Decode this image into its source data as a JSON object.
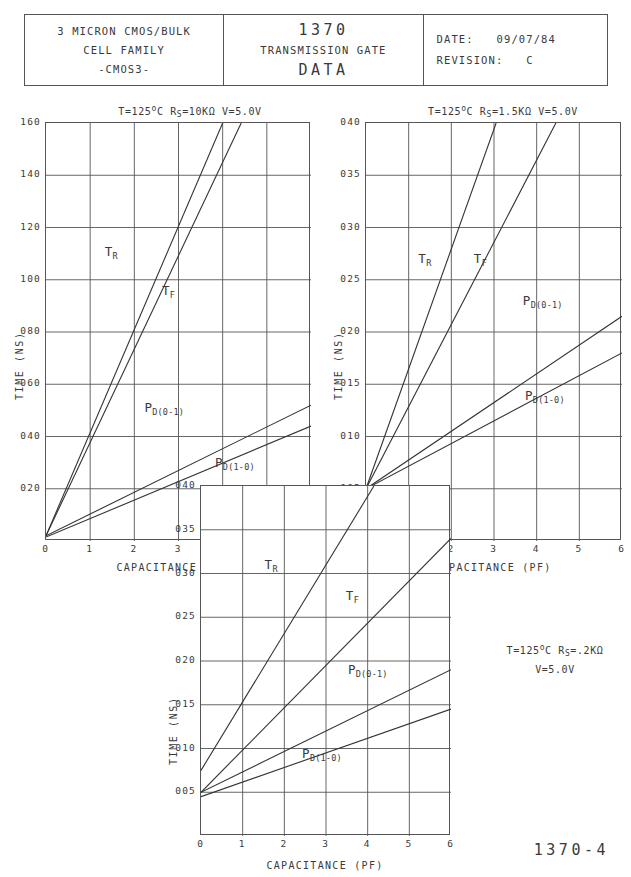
{
  "title_block": {
    "left": {
      "line1": "3 MICRON CMOS/BULK",
      "line2": "CELL FAMILY",
      "line3": "-CMOS3-"
    },
    "center": {
      "number": "1370",
      "subtitle": "TRANSMISSION GATE",
      "type": "DATA"
    },
    "right": {
      "date_label": "DATE:",
      "date_value": "09/07/84",
      "revision_label": "REVISION:",
      "revision_value": "C"
    }
  },
  "page_number": "1370-4",
  "common": {
    "xlabel": "CAPACITANCE (PF)",
    "ylabel": "TIME (NS)",
    "xticks": [
      "0",
      "1",
      "2",
      "3",
      "4",
      "5",
      "6"
    ],
    "curve_names": {
      "tr": "T",
      "tr_sub": "R",
      "tf": "T",
      "tf_sub": "F",
      "pd01": "P",
      "pd01_sub": "D(0-1)",
      "pd10": "P",
      "pd10_sub": "D(1-0)"
    }
  },
  "chart_data": [
    {
      "id": "chart-1",
      "type": "line",
      "title": "T=125°C  Rs=10KΩ  V=5.0V",
      "title_parts": {
        "temp": "T=125",
        "deg": "o",
        "unit": "C  R",
        "rs_sub": "S",
        "rs": "=10KΩ  V=5.0V"
      },
      "xlabel": "CAPACITANCE (PF)",
      "ylabel": "TIME (NS)",
      "xlim": [
        0,
        6
      ],
      "ylim": [
        0,
        1.6
      ],
      "xticks": [
        0,
        1,
        2,
        3,
        4,
        5,
        6
      ],
      "yticks": [
        0.2,
        0.4,
        0.6,
        0.8,
        1.0,
        1.2,
        1.4,
        1.6
      ],
      "ytick_labels": [
        "020",
        "040",
        "060",
        "080",
        "100",
        "120",
        "140",
        "160"
      ],
      "grid": true,
      "series": [
        {
          "name": "TR",
          "label": "T",
          "sub": "R",
          "points": [
            [
              0,
              0.02
            ],
            [
              4.0,
              1.6
            ]
          ],
          "label_pos": [
            1.35,
            1.1
          ]
        },
        {
          "name": "TF",
          "label": "T",
          "sub": "F",
          "points": [
            [
              0,
              0.02
            ],
            [
              4.42,
              1.6
            ]
          ],
          "label_pos": [
            2.65,
            0.95
          ]
        },
        {
          "name": "PD(0-1)",
          "label": "P",
          "sub": "D(0-1)",
          "points": [
            [
              0,
              0.02
            ],
            [
              6,
              0.52
            ]
          ],
          "label_pos": [
            2.25,
            0.5
          ]
        },
        {
          "name": "PD(1-0)",
          "label": "P",
          "sub": "D(1-0)",
          "points": [
            [
              0,
              0.015
            ],
            [
              6,
              0.44
            ]
          ],
          "label_pos": [
            3.85,
            0.29
          ]
        }
      ]
    },
    {
      "id": "chart-2",
      "type": "line",
      "title": "T=125°C  Rs=1.5KΩ  V=5.0V",
      "title_parts": {
        "temp": "T=125",
        "deg": "o",
        "unit": "C  R",
        "rs_sub": "S",
        "rs": "=1.5KΩ  V=5.0V"
      },
      "xlabel": "CAPACITANCE (PF)",
      "ylabel": "TIME (NS)",
      "xlim": [
        0,
        6
      ],
      "ylim": [
        0,
        0.04
      ],
      "xticks": [
        0,
        1,
        2,
        3,
        4,
        5,
        6
      ],
      "yticks": [
        0.005,
        0.01,
        0.015,
        0.02,
        0.025,
        0.03,
        0.035,
        0.04
      ],
      "ytick_labels": [
        "005",
        "010",
        "015",
        "020",
        "025",
        "030",
        "035",
        "040"
      ],
      "grid": true,
      "series": [
        {
          "name": "TR",
          "label": "T",
          "sub": "R",
          "points": [
            [
              0,
              0.005
            ],
            [
              3.05,
              0.04
            ]
          ],
          "label_pos": [
            1.25,
            0.0268
          ]
        },
        {
          "name": "TF",
          "label": "T",
          "sub": "F",
          "points": [
            [
              0,
              0.005
            ],
            [
              4.45,
              0.04
            ]
          ],
          "label_pos": [
            2.55,
            0.0268
          ]
        },
        {
          "name": "PD(0-1)",
          "label": "P",
          "sub": "D(0-1)",
          "points": [
            [
              0,
              0.005
            ],
            [
              6,
              0.0215
            ]
          ],
          "label_pos": [
            3.7,
            0.0228
          ]
        },
        {
          "name": "PD(1-0)",
          "label": "P",
          "sub": "D(1-0)",
          "points": [
            [
              0,
              0.005
            ],
            [
              6,
              0.018
            ]
          ],
          "label_pos": [
            3.75,
            0.0137
          ]
        }
      ]
    },
    {
      "id": "chart-3",
      "type": "line",
      "title": "T=125°C Rs=.2KΩ V=5.0V",
      "annotation_line1_parts": {
        "temp": "T=125",
        "deg": "o",
        "unit": "C  R",
        "rs_sub": "S",
        "rs": "=.2KΩ"
      },
      "annotation_line2": "V=5.0V",
      "xlabel": "CAPACITANCE (PF)",
      "ylabel": "TIME (NS)",
      "xlim": [
        0,
        6
      ],
      "ylim": [
        0,
        0.04
      ],
      "xticks": [
        0,
        1,
        2,
        3,
        4,
        5,
        6
      ],
      "yticks": [
        0.005,
        0.01,
        0.015,
        0.02,
        0.025,
        0.03,
        0.035,
        0.04
      ],
      "ytick_labels": [
        "005",
        "010",
        "015",
        "020",
        "025",
        "030",
        "035",
        "040"
      ],
      "grid": true,
      "series": [
        {
          "name": "TR",
          "label": "T",
          "sub": "R",
          "points": [
            [
              0,
              0.0075
            ],
            [
              4.15,
              0.04
            ]
          ],
          "label_pos": [
            1.55,
            0.0307
          ]
        },
        {
          "name": "TF",
          "label": "T",
          "sub": "F",
          "points": [
            [
              0,
              0.005
            ],
            [
              6,
              0.034
            ]
          ],
          "label_pos": [
            3.5,
            0.0272
          ]
        },
        {
          "name": "PD(0-1)",
          "label": "P",
          "sub": "D(0-1)",
          "points": [
            [
              0,
              0.005
            ],
            [
              6,
              0.019
            ]
          ],
          "label_pos": [
            3.55,
            0.0188
          ]
        },
        {
          "name": "PD(1-0)",
          "label": "P",
          "sub": "D(1-0)",
          "points": [
            [
              0,
              0.0045
            ],
            [
              6,
              0.0145
            ]
          ],
          "label_pos": [
            2.45,
            0.0092
          ]
        }
      ]
    }
  ]
}
